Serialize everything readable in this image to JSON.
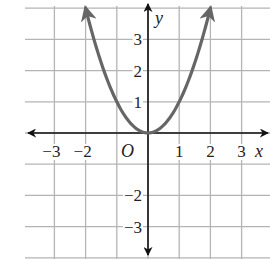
{
  "chart_data": {
    "type": "line",
    "title": "",
    "function": "y = x^2",
    "xlabel": "x",
    "ylabel": "y",
    "origin_label": "O",
    "xlim": [
      -3.8,
      3.9
    ],
    "ylim": [
      -4,
      4
    ],
    "grid": true,
    "x_ticks": [
      -3,
      -2,
      1,
      2,
      3
    ],
    "x_tick_labels": [
      "−3",
      "−2",
      "1",
      "2",
      "3"
    ],
    "y_ticks": [
      3,
      2,
      1,
      -2,
      -3
    ],
    "y_tick_labels": [
      "3",
      "2",
      "1",
      "−2",
      "−3"
    ],
    "series": [
      {
        "name": "parabola",
        "color": "#666666",
        "arrows_at_ends": true,
        "x": [
          -2,
          -1.5,
          -1,
          -0.5,
          0,
          0.5,
          1,
          1.5,
          2
        ],
        "y": [
          4,
          2.25,
          1,
          0.25,
          0,
          0.25,
          1,
          2.25,
          4
        ]
      }
    ]
  },
  "colors": {
    "grid": "#b4b4b4",
    "axis": "#111111",
    "curve": "#666666",
    "background": "#ffffff"
  }
}
